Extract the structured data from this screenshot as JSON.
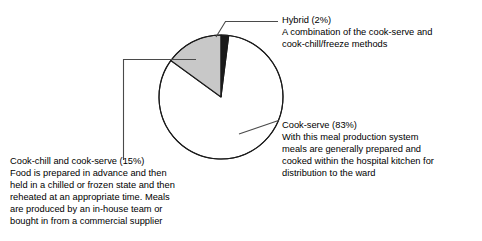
{
  "chart_data": {
    "type": "pie",
    "title": "",
    "subtitle": "",
    "xlabel": "",
    "ylabel": "",
    "legend_position": "callouts",
    "grid": false,
    "units": "percent",
    "start_angle_deg": 0,
    "direction": "clockwise",
    "categories": [
      "Hybrid",
      "Cook-serve",
      "Cook-chill and cook-serve"
    ],
    "values": [
      2,
      83,
      15
    ],
    "slices": [
      {
        "label": "Hybrid",
        "value": 2,
        "value_text": "(2%)",
        "color": "#1a1a1a",
        "callout_title": "Hybrid (2%)",
        "callout_lines": [
          "A combination of the cook-serve and",
          "cook-chill/freeze methods"
        ]
      },
      {
        "label": "Cook-serve",
        "value": 83,
        "value_text": "(83%)",
        "color": "#ffffff",
        "callout_title": "Cook-serve (83%)",
        "callout_lines": [
          "With this meal production system",
          "meals are generally prepared and",
          "cooked within the hospital kitchen for",
          "distribution to the ward"
        ]
      },
      {
        "label": "Cook-chill and cook-serve",
        "value": 15,
        "value_text": "(15%)",
        "color": "#c8c8c8",
        "callout_title": "Cook-chill and cook-serve (15%)",
        "callout_lines": [
          "Food is prepared in advance and then",
          "held in a chilled or frozen state and then",
          "reheated at an appropriate time. Meals",
          "are produced by an in-house team or",
          "bought in from a commercial supplier"
        ]
      }
    ]
  },
  "style": {
    "outline_color": "#1a1a1a",
    "leader_color": "#4a4a4a",
    "gray_slice": "#c8c8c8",
    "black_slice": "#1a1a1a",
    "white_slice": "#ffffff",
    "background": "#ffffff"
  }
}
